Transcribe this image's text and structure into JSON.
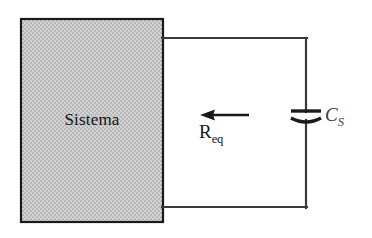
{
  "diagram": {
    "type": "circuit-schematic",
    "background_color": "#ffffff",
    "block": {
      "label": "Sistema",
      "fill_color": "#c8c8c8",
      "border_color": "#1a1a1a",
      "text_color": "#141414",
      "fill_style": "halftone-dither",
      "x": 21,
      "y": 19,
      "width": 142,
      "height": 203
    },
    "wires": {
      "color": "#3a3a3a",
      "width": 2,
      "top": {
        "x1": 163,
        "y1": 38,
        "x2": 306,
        "y2": 38
      },
      "right": {
        "x1": 306,
        "y1": 38,
        "x2": 306,
        "y2": 207
      },
      "bottom": {
        "x1": 163,
        "y1": 207,
        "x2": 306,
        "y2": 207
      }
    },
    "capacitor": {
      "label": "C",
      "subscript": "S",
      "label_full": "C_S",
      "style": "polarized",
      "plate_color": "#1a1a1a",
      "label_color": "#3a3a3a",
      "center_x": 306,
      "plate_flat_y": 111,
      "plate_curved_y": 120,
      "plate_half_width": 15
    },
    "arrow": {
      "label": "R",
      "subscript": "eq",
      "label_full": "R_eq",
      "direction": "left",
      "meaning": "looking-into-system",
      "color": "#1a1a1a",
      "tip_x": 200,
      "tail_x": 249,
      "y": 115
    }
  }
}
